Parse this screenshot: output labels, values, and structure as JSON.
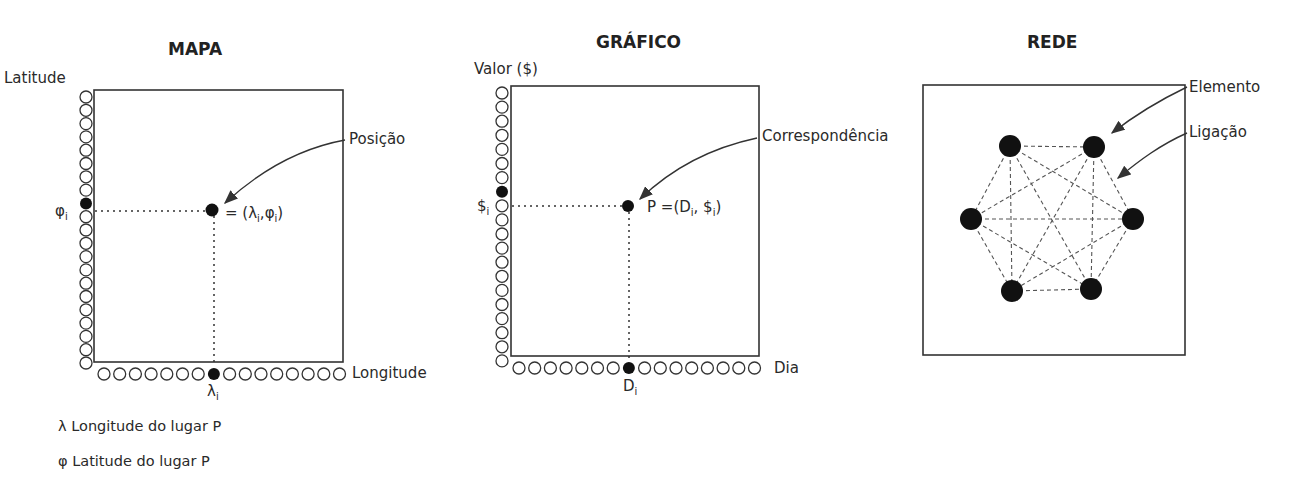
{
  "panels": {
    "map": {
      "title": "MAPA",
      "y_axis_label": "Latitude",
      "x_axis_label": "Longitude",
      "point_label": "Posição",
      "point_formula_prefix": "= (λ",
      "point_formula_sub1": "i",
      "point_formula_mid": ",φ",
      "point_formula_sub2": "i",
      "point_formula_suffix": ")",
      "y_marker": "φ",
      "y_marker_sub": "i",
      "x_marker": "λ",
      "x_marker_sub": "i",
      "y_axis_circles": {
        "open_above": 8,
        "filled": 1,
        "open_below": 12
      },
      "x_axis_circles": {
        "open_left": 7,
        "filled": 1,
        "open_right": 8
      }
    },
    "graph": {
      "title": "GRÁFICO",
      "y_axis_label": "Valor ($)",
      "x_axis_label": "Dia",
      "point_label": "Correspondência",
      "point_formula_prefix": "P =(D",
      "point_formula_sub1": "i",
      "point_formula_mid": ", $",
      "point_formula_sub2": "i",
      "point_formula_suffix": ")",
      "y_marker": "$",
      "y_marker_sub": "i",
      "x_marker": "D",
      "x_marker_sub": "i",
      "y_axis_circles": {
        "open_above": 7,
        "filled": 1,
        "open_below": 12
      },
      "x_axis_circles": {
        "open_left": 7,
        "filled": 1,
        "open_right": 8
      }
    },
    "network": {
      "title": "REDE",
      "node_label": "Elemento",
      "edge_label": "Ligação",
      "node_count": 6,
      "edges": "complete graph (all nodes connected)"
    }
  },
  "legend": [
    {
      "symbol": "λ",
      "text": "Longitude do lugar P"
    },
    {
      "symbol": "φ",
      "text": "Latitude do lugar P"
    }
  ]
}
